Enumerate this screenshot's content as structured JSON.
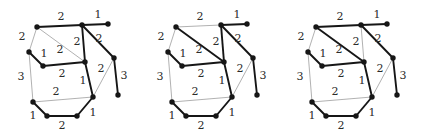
{
  "figure": {
    "background": "#ffffff",
    "width": 423,
    "height": 136,
    "node_color": "#161616",
    "node_radius": 2.7,
    "edge_bold_color": "#161616",
    "edge_bold_width": 1.9,
    "edge_thin_color": "#9d9d9d",
    "edge_thin_width": 0.8,
    "label_color": "#2b2b2b",
    "label_font_size": 11,
    "nodes": [
      {
        "id": "A",
        "x": 37,
        "y": 27
      },
      {
        "id": "B",
        "x": 82,
        "y": 25
      },
      {
        "id": "C",
        "x": 108,
        "y": 24
      },
      {
        "id": "D",
        "x": 29,
        "y": 52
      },
      {
        "id": "E",
        "x": 43,
        "y": 66
      },
      {
        "id": "F",
        "x": 85,
        "y": 62
      },
      {
        "id": "G",
        "x": 114,
        "y": 58
      },
      {
        "id": "H",
        "x": 93,
        "y": 97
      },
      {
        "id": "I",
        "x": 118,
        "y": 95
      },
      {
        "id": "J",
        "x": 33,
        "y": 102
      },
      {
        "id": "K",
        "x": 47,
        "y": 116
      },
      {
        "id": "L",
        "x": 77,
        "y": 116
      }
    ],
    "edges": [
      {
        "id": "AB",
        "from": "A",
        "to": "B",
        "weight": "2",
        "lx": 61,
        "ly": 16
      },
      {
        "id": "BC",
        "from": "B",
        "to": "C",
        "weight": "1",
        "lx": 98,
        "ly": 14
      },
      {
        "id": "AD",
        "from": "A",
        "to": "D",
        "weight": "2",
        "lx": 22,
        "ly": 36
      },
      {
        "id": "AF",
        "from": "A",
        "to": "F",
        "weight": "2",
        "lx": 60,
        "ly": 49
      },
      {
        "id": "DE",
        "from": "D",
        "to": "E",
        "weight": "1",
        "lx": 44,
        "ly": 53
      },
      {
        "id": "BF",
        "from": "B",
        "to": "F",
        "weight": "2",
        "lx": 77,
        "ly": 41
      },
      {
        "id": "BG",
        "from": "B",
        "to": "G",
        "weight": "2",
        "lx": 99,
        "ly": 38
      },
      {
        "id": "EF",
        "from": "E",
        "to": "F",
        "weight": "2",
        "lx": 62,
        "ly": 73
      },
      {
        "id": "DJ",
        "from": "D",
        "to": "J",
        "weight": "3",
        "lx": 21,
        "ly": 76
      },
      {
        "id": "FH",
        "from": "F",
        "to": "H",
        "weight": "1",
        "lx": 83,
        "ly": 80
      },
      {
        "id": "GH",
        "from": "G",
        "to": "H",
        "weight": "2",
        "lx": 101,
        "ly": 68
      },
      {
        "id": "GI",
        "from": "G",
        "to": "I",
        "weight": "3",
        "lx": 124,
        "ly": 75
      },
      {
        "id": "JH",
        "from": "J",
        "to": "H",
        "weight": "2",
        "lx": 56,
        "ly": 91
      },
      {
        "id": "JK",
        "from": "J",
        "to": "K",
        "weight": "1",
        "lx": 33,
        "ly": 115
      },
      {
        "id": "KL",
        "from": "K",
        "to": "L",
        "weight": "2",
        "lx": 62,
        "ly": 125
      },
      {
        "id": "LH",
        "from": "L",
        "to": "H",
        "weight": "1",
        "lx": 93,
        "ly": 112
      }
    ],
    "graphs": [
      {
        "name": "spanning-tree-1",
        "dx": 0,
        "bold_edges": [
          "AB",
          "BC",
          "DE",
          "BF",
          "BG",
          "EF",
          "FH",
          "GI",
          "JK",
          "KL",
          "LH"
        ]
      },
      {
        "name": "spanning-tree-2",
        "dx": 139,
        "bold_edges": [
          "AF",
          "BC",
          "DE",
          "BF",
          "BG",
          "EF",
          "FH",
          "GI",
          "JK",
          "KL",
          "LH"
        ]
      },
      {
        "name": "spanning-tree-3",
        "dx": 279,
        "bold_edges": [
          "AB",
          "AF",
          "BC",
          "DE",
          "BG",
          "EF",
          "FH",
          "GI",
          "JK",
          "KL",
          "LH"
        ]
      }
    ]
  }
}
